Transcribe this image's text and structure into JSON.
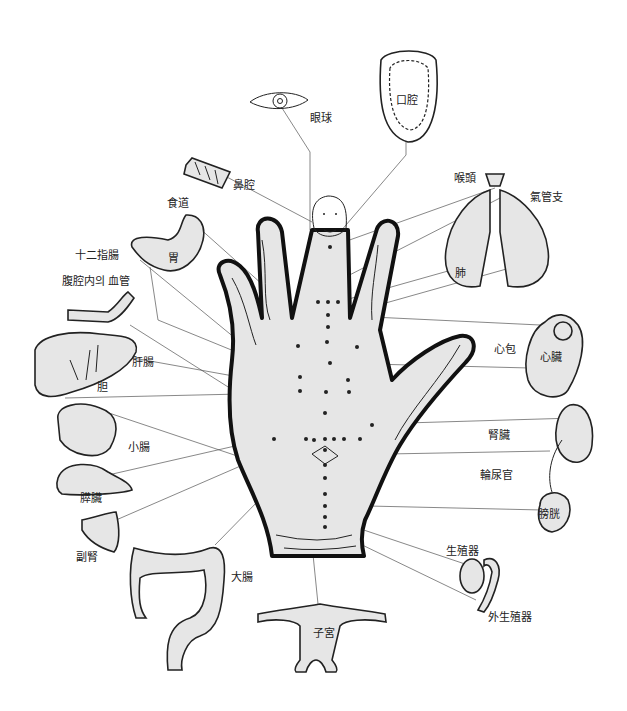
{
  "diagram": {
    "type": "hand reflexology map",
    "colors": {
      "fill": "#e6e6e6",
      "stroke": "#111111",
      "background": "#ffffff",
      "leader": "#555555"
    },
    "labels": [
      {
        "id": "eyeball",
        "text": "眼球",
        "x": 310,
        "y": 113
      },
      {
        "id": "mouth",
        "text": "口腔",
        "x": 396,
        "y": 95
      },
      {
        "id": "nasal",
        "text": "鼻腔",
        "x": 233,
        "y": 180
      },
      {
        "id": "esophagus",
        "text": "食道",
        "x": 167,
        "y": 198
      },
      {
        "id": "larynx",
        "text": "喉頭",
        "x": 454,
        "y": 173
      },
      {
        "id": "bronchus",
        "text": "氣管支",
        "x": 530,
        "y": 192
      },
      {
        "id": "stomach",
        "text": "胃",
        "x": 168,
        "y": 253
      },
      {
        "id": "duodenum",
        "text": "十二指腸",
        "x": 75,
        "y": 250
      },
      {
        "id": "abdominal-vessels",
        "text": "腹腔内의 血管",
        "x": 62,
        "y": 276
      },
      {
        "id": "lung",
        "text": "肺",
        "x": 455,
        "y": 268
      },
      {
        "id": "pericardium",
        "text": "心包",
        "x": 494,
        "y": 344
      },
      {
        "id": "heart",
        "text": "心臟",
        "x": 540,
        "y": 352
      },
      {
        "id": "liver",
        "text": "肝腸",
        "x": 132,
        "y": 357
      },
      {
        "id": "gallbladder",
        "text": "胆",
        "x": 97,
        "y": 382
      },
      {
        "id": "small-intestine",
        "text": "小腸",
        "x": 128,
        "y": 442
      },
      {
        "id": "kidney",
        "text": "腎臟",
        "x": 488,
        "y": 430
      },
      {
        "id": "ureter",
        "text": "輪尿官",
        "x": 480,
        "y": 470
      },
      {
        "id": "pancreas",
        "text": "膵臟",
        "x": 80,
        "y": 493
      },
      {
        "id": "bladder",
        "text": "膀胱",
        "x": 538,
        "y": 509
      },
      {
        "id": "adrenal",
        "text": "副腎",
        "x": 76,
        "y": 552
      },
      {
        "id": "reproductive",
        "text": "生殖器",
        "x": 446,
        "y": 546
      },
      {
        "id": "large-intestine",
        "text": "大腸",
        "x": 231,
        "y": 572
      },
      {
        "id": "uterus",
        "text": "子宮",
        "x": 313,
        "y": 628
      },
      {
        "id": "external-genitalia",
        "text": "外生殖器",
        "x": 488,
        "y": 612
      }
    ]
  }
}
